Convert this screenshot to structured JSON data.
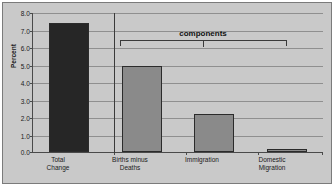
{
  "chart_data": {
    "type": "bar",
    "title": "",
    "xlabel": "",
    "ylabel": "Percent",
    "ylim": [
      0.0,
      8.0
    ],
    "ytick_labels": [
      "8.0",
      "7.0",
      "6.0",
      "5.0",
      "4.0",
      "3.0",
      "2.0",
      "1.0",
      "0.0"
    ],
    "ytick_values": [
      8.0,
      7.0,
      6.0,
      5.0,
      4.0,
      3.0,
      2.0,
      1.0,
      0.0
    ],
    "grid": true,
    "legend": "none",
    "categories": [
      "Total Change",
      "Births minus Deaths",
      "Immigration",
      "Domestic Migration"
    ],
    "values": [
      7.4,
      4.9,
      2.2,
      0.2
    ],
    "bar_colors": [
      "#262626",
      "#8a8a8a",
      "#8a8a8a",
      "#8a8a8a"
    ],
    "annotations": [
      {
        "text": "components",
        "spans": [
          "Births minus Deaths",
          "Immigration",
          "Domestic Migration"
        ]
      }
    ]
  },
  "axis": {
    "y_title": "Percent",
    "ticks": [
      {
        "label": "8.0",
        "value": 8.0
      },
      {
        "label": "7.0",
        "value": 7.0
      },
      {
        "label": "6.0",
        "value": 6.0
      },
      {
        "label": "5.0",
        "value": 5.0
      },
      {
        "label": "4.0",
        "value": 4.0
      },
      {
        "label": "3.0",
        "value": 3.0
      },
      {
        "label": "2.0",
        "value": 2.0
      },
      {
        "label": "1.0",
        "value": 1.0
      },
      {
        "label": "0.0",
        "value": 0.0
      }
    ]
  },
  "categories": [
    {
      "line1": "Total",
      "line2": "Change"
    },
    {
      "line1": "Births minus",
      "line2": "Deaths"
    },
    {
      "line1": "Immigration",
      "line2": ""
    },
    {
      "line1": "Domestic",
      "line2": "Migration"
    }
  ],
  "annotation": {
    "components_label": "components"
  },
  "colors": {
    "background": "#c9c9c9",
    "frame_border": "#7b7b7b",
    "axis": "#4a4a4a",
    "gridline": "#8f8f8f",
    "bar_dark": "#262626",
    "bar_gray": "#8a8a8a",
    "bar_outline": "#2b2b2b",
    "text": "#1a1a1a"
  }
}
